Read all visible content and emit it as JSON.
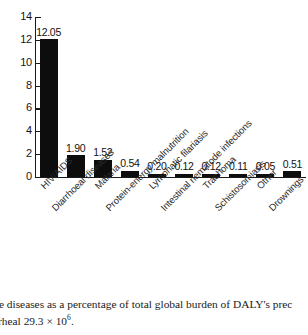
{
  "chart_data": {
    "type": "bar",
    "title": "",
    "xlabel": "",
    "ylabel": "",
    "ylim": [
      0,
      14
    ],
    "yticks": [
      "0",
      "2",
      "4",
      "6",
      "8",
      "10",
      "12",
      "14"
    ],
    "grid": false,
    "legend": null,
    "categories": [
      "HIV/AIDS",
      "Diarrhoeal diseases",
      "Malaria",
      "Protein-energy malnutrition",
      "Lymphatic filariasis",
      "Intestinal nematode infections",
      "Trachoma",
      "Schistosomiasis",
      "Other",
      "Drownings"
    ],
    "values": [
      12.05,
      1.9,
      1.52,
      0.54,
      0.2,
      0.12,
      0.12,
      0.11,
      0.05,
      0.51
    ],
    "value_labels": [
      "12.05",
      "1.90",
      "1.52",
      "0.54",
      "0.20",
      "0.12",
      "0.12",
      "0.11",
      "0.05",
      "0.51"
    ],
    "bar_color": "#0d0d0d",
    "axis_color": "#1a1a1a"
  },
  "caption": {
    "line1": "borne diseases as a percentage of total global burden of DALY's prec",
    "line2_pre": "iarrheal 29.3 × 10",
    "line2_sup": "6",
    "line2_post": "."
  }
}
